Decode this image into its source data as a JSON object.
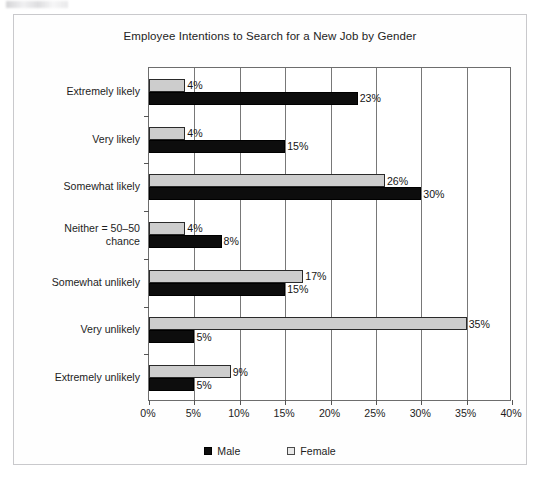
{
  "chart_data": {
    "type": "bar",
    "orientation": "horizontal",
    "title": "Employee Intentions to Search for a New Job by Gender",
    "xlabel": "",
    "ylabel": "",
    "xlim": [
      0,
      40
    ],
    "xtick_labels": [
      "0%",
      "5%",
      "10%",
      "15%",
      "20%",
      "25%",
      "30%",
      "35%",
      "40%"
    ],
    "xtick_values": [
      0,
      5,
      10,
      15,
      20,
      25,
      30,
      35,
      40
    ],
    "grid": true,
    "legend_position": "bottom",
    "categories": [
      "Extremely likely",
      "Very likely",
      "Somewhat likely",
      "Neither = 50–50\nchance",
      "Somewhat unlikely",
      "Very unlikely",
      "Extremely unlikely"
    ],
    "series": [
      {
        "name": "Male",
        "color": "#0d0d0d",
        "values": [
          23,
          15,
          30,
          8,
          15,
          5,
          5
        ],
        "labels": [
          "23%",
          "15%",
          "30%",
          "8%",
          "15%",
          "5%",
          "5%"
        ]
      },
      {
        "name": "Female",
        "color": "#cdcdcd",
        "values": [
          4,
          4,
          26,
          4,
          17,
          35,
          9
        ],
        "labels": [
          "4%",
          "4%",
          "26%",
          "4%",
          "17%",
          "35%",
          "9%"
        ]
      }
    ],
    "legend": [
      {
        "label": "Male",
        "swatch": "filled-black-square"
      },
      {
        "label": "Female",
        "swatch": "outlined-light-square"
      }
    ]
  }
}
